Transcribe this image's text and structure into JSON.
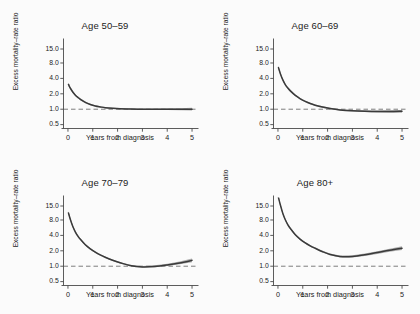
{
  "figure": {
    "background_color": "#fbfbfb",
    "layout": "2x2 small multiples",
    "curve_color": "#3a3a3a",
    "band_color": "#8e8e8e",
    "axis_color": "#4a4a4a",
    "refline_color": "#6e6e6e"
  },
  "chart_data": [
    {
      "type": "line",
      "title": "Age 50–59",
      "xlabel": "Years from diagnosis",
      "ylabel": "Excess mortality–rate ratio",
      "yscale": "log",
      "ylim": [
        0.42,
        22.0
      ],
      "xlim": [
        -0.18,
        5.18
      ],
      "yticks": [
        0.5,
        1.0,
        2.0,
        4.0,
        8.0,
        15.0
      ],
      "yticklabels": [
        "0.5",
        "1.0",
        "2.0",
        "4.0",
        "8.0",
        "15.0"
      ],
      "xticks": [
        0,
        1,
        2,
        3,
        4,
        5
      ],
      "xticklabels": [
        "0",
        "1",
        "2",
        "3",
        "4",
        "5"
      ],
      "grid": false,
      "reference_line": {
        "y": 1.0,
        "style": "dashed"
      },
      "x": [
        0.02,
        0.1,
        0.2,
        0.3,
        0.4,
        0.5,
        0.7,
        0.9,
        1.1,
        1.3,
        1.5,
        1.8,
        2.1,
        2.5,
        3.0,
        3.5,
        4.0,
        4.5,
        5.0
      ],
      "series": [
        {
          "name": "Excess mortality-rate ratio",
          "values": [
            3.05,
            2.55,
            2.15,
            1.88,
            1.7,
            1.56,
            1.36,
            1.24,
            1.16,
            1.11,
            1.07,
            1.04,
            1.02,
            1.01,
            1.0,
            1.0,
            1.0,
            1.0,
            1.0
          ],
          "ci_lower": [
            2.82,
            2.4,
            2.04,
            1.8,
            1.63,
            1.5,
            1.31,
            1.2,
            1.13,
            1.08,
            1.04,
            1.01,
            0.99,
            0.98,
            0.97,
            0.97,
            0.96,
            0.95,
            0.94
          ],
          "ci_upper": [
            3.3,
            2.72,
            2.27,
            1.97,
            1.78,
            1.63,
            1.41,
            1.28,
            1.2,
            1.14,
            1.1,
            1.07,
            1.05,
            1.04,
            1.03,
            1.03,
            1.04,
            1.05,
            1.07
          ]
        }
      ]
    },
    {
      "type": "line",
      "title": "Age 60–69",
      "xlabel": "Years from diagnosis",
      "ylabel": "Excess mortality–rate ratio",
      "yscale": "log",
      "ylim": [
        0.42,
        22.0
      ],
      "xlim": [
        -0.18,
        5.18
      ],
      "yticks": [
        0.5,
        1.0,
        2.0,
        4.0,
        8.0,
        15.0
      ],
      "yticklabels": [
        "0.5",
        "1.0",
        "2.0",
        "4.0",
        "8.0",
        "15.0"
      ],
      "xticks": [
        0,
        1,
        2,
        3,
        4,
        5
      ],
      "xticklabels": [
        "0",
        "1",
        "2",
        "3",
        "4",
        "5"
      ],
      "grid": false,
      "reference_line": {
        "y": 1.0,
        "style": "dashed"
      },
      "x": [
        0.02,
        0.1,
        0.2,
        0.3,
        0.4,
        0.5,
        0.7,
        0.9,
        1.1,
        1.3,
        1.5,
        1.8,
        2.1,
        2.5,
        3.0,
        3.5,
        4.0,
        4.5,
        5.0
      ],
      "series": [
        {
          "name": "Excess mortality-rate ratio",
          "values": [
            6.5,
            4.9,
            3.7,
            3.0,
            2.58,
            2.28,
            1.86,
            1.6,
            1.42,
            1.29,
            1.2,
            1.1,
            1.03,
            0.97,
            0.93,
            0.91,
            0.9,
            0.9,
            0.91
          ],
          "ci_lower": [
            6.0,
            4.6,
            3.5,
            2.86,
            2.46,
            2.18,
            1.79,
            1.54,
            1.37,
            1.25,
            1.16,
            1.06,
            1.0,
            0.94,
            0.9,
            0.88,
            0.86,
            0.85,
            0.85
          ],
          "ci_upper": [
            7.05,
            5.22,
            3.92,
            3.16,
            2.71,
            2.39,
            1.94,
            1.66,
            1.47,
            1.34,
            1.24,
            1.14,
            1.07,
            1.01,
            0.97,
            0.95,
            0.94,
            0.95,
            0.97
          ]
        }
      ]
    },
    {
      "type": "line",
      "title": "Age 70–79",
      "xlabel": "Years from diagnosis",
      "ylabel": "Excess mortality–rate ratio",
      "yscale": "log",
      "ylim": [
        0.42,
        22.0
      ],
      "xlim": [
        -0.18,
        5.18
      ],
      "yticks": [
        0.5,
        1.0,
        2.0,
        4.0,
        8.0,
        15.0
      ],
      "yticklabels": [
        "0.5",
        "1.0",
        "2.0",
        "4.0",
        "8.0",
        "15.0"
      ],
      "xticks": [
        0,
        1,
        2,
        3,
        4,
        5
      ],
      "xticklabels": [
        "0",
        "1",
        "2",
        "3",
        "4",
        "5"
      ],
      "grid": false,
      "reference_line": {
        "y": 1.0,
        "style": "dashed"
      },
      "x": [
        0.02,
        0.1,
        0.2,
        0.3,
        0.4,
        0.5,
        0.7,
        0.9,
        1.1,
        1.3,
        1.5,
        1.8,
        2.1,
        2.5,
        3.0,
        3.5,
        4.0,
        4.5,
        5.0
      ],
      "series": [
        {
          "name": "Excess mortality-rate ratio",
          "values": [
            11.0,
            8.1,
            5.9,
            4.65,
            3.88,
            3.35,
            2.62,
            2.18,
            1.88,
            1.66,
            1.5,
            1.31,
            1.17,
            1.03,
            0.97,
            0.99,
            1.06,
            1.16,
            1.3
          ],
          "ci_lower": [
            10.2,
            7.6,
            5.58,
            4.42,
            3.7,
            3.2,
            2.52,
            2.1,
            1.82,
            1.61,
            1.45,
            1.27,
            1.13,
            1.0,
            0.94,
            0.95,
            1.01,
            1.09,
            1.2
          ],
          "ci_upper": [
            11.85,
            8.62,
            6.24,
            4.89,
            4.07,
            3.51,
            2.73,
            2.27,
            1.95,
            1.72,
            1.55,
            1.36,
            1.21,
            1.07,
            1.01,
            1.04,
            1.12,
            1.24,
            1.41
          ]
        }
      ]
    },
    {
      "type": "line",
      "title": "Age 80+",
      "xlabel": "Years from diagnosis",
      "ylabel": "Excess mortality–rate ratio",
      "yscale": "log",
      "ylim": [
        0.42,
        22.0
      ],
      "xlim": [
        -0.18,
        5.18
      ],
      "yticks": [
        0.5,
        1.0,
        2.0,
        4.0,
        8.0,
        15.0
      ],
      "yticklabels": [
        "0.5",
        "1.0",
        "2.0",
        "4.0",
        "8.0",
        "15.0"
      ],
      "xticks": [
        0,
        1,
        2,
        3,
        4,
        5
      ],
      "xticklabels": [
        "0",
        "1",
        "2",
        "3",
        "4",
        "5"
      ],
      "grid": false,
      "reference_line": {
        "y": 1.0,
        "style": "dashed"
      },
      "x": [
        0.02,
        0.1,
        0.2,
        0.3,
        0.4,
        0.5,
        0.7,
        0.9,
        1.1,
        1.3,
        1.5,
        1.8,
        2.1,
        2.5,
        3.0,
        3.5,
        4.0,
        4.5,
        5.0
      ],
      "series": [
        {
          "name": "Excess mortality-rate ratio",
          "values": [
            22.0,
            15.5,
            10.6,
            8.0,
            6.45,
            5.45,
            4.12,
            3.35,
            2.85,
            2.5,
            2.24,
            1.92,
            1.7,
            1.55,
            1.55,
            1.67,
            1.85,
            2.05,
            2.25
          ],
          "ci_lower": [
            20.0,
            14.5,
            10.0,
            7.6,
            6.15,
            5.2,
            3.95,
            3.22,
            2.74,
            2.41,
            2.16,
            1.85,
            1.63,
            1.48,
            1.48,
            1.58,
            1.74,
            1.91,
            2.07
          ],
          "ci_upper": [
            24.0,
            16.6,
            11.25,
            8.42,
            6.77,
            5.72,
            4.3,
            3.49,
            2.97,
            2.6,
            2.33,
            2.0,
            1.77,
            1.62,
            1.63,
            1.77,
            1.97,
            2.2,
            2.45
          ]
        }
      ]
    }
  ]
}
